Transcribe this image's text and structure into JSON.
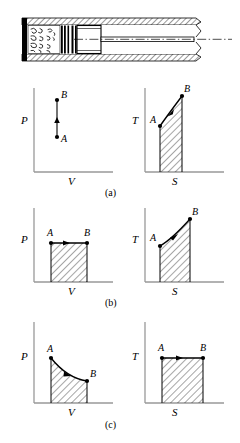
{
  "figure": {
    "apparatus": {
      "name": "insulated-cylinder-piston",
      "parts": {
        "cylinder_wall": "hatched-wall",
        "gas_region": "gas-molecules",
        "piston": "piston-block",
        "piston_rings": "piston-rings",
        "rod": "piston-rod",
        "centerline": "center-line",
        "break": "break-line"
      }
    },
    "rows": [
      {
        "caption": "(a)",
        "left": {
          "name": "pv-diagram-a",
          "ylabel": "P",
          "xlabel": "V",
          "points": [
            {
              "label": "A",
              "x": 0.3,
              "y": 0.22
            },
            {
              "label": "B",
              "x": 0.3,
              "y": 0.78
            }
          ],
          "process": "isochoric-up",
          "shaded": false,
          "arrow": "up"
        },
        "right": {
          "name": "ts-diagram-a",
          "ylabel": "T",
          "xlabel": "S",
          "points": [
            {
              "label": "A",
              "x": 0.2,
              "y": 0.56
            },
            {
              "label": "B",
              "x": 0.55,
              "y": 0.92
            }
          ],
          "process": "curve-up",
          "shaded": true,
          "arrow": "up-right"
        }
      },
      {
        "caption": "(b)",
        "left": {
          "name": "pv-diagram-b",
          "ylabel": "P",
          "xlabel": "V",
          "points": [
            {
              "label": "A",
              "x": 0.22,
              "y": 0.72
            },
            {
              "label": "B",
              "x": 0.62,
              "y": 0.72
            }
          ],
          "process": "isobaric",
          "shaded": true,
          "arrow": "right"
        },
        "right": {
          "name": "ts-diagram-b",
          "ylabel": "T",
          "xlabel": "S",
          "points": [
            {
              "label": "A",
              "x": 0.2,
              "y": 0.56
            },
            {
              "label": "B",
              "x": 0.55,
              "y": 0.92
            }
          ],
          "process": "curve-up",
          "shaded": true,
          "arrow": "up-right"
        }
      },
      {
        "caption": "(c)",
        "left": {
          "name": "pv-diagram-c",
          "ylabel": "P",
          "xlabel": "V",
          "points": [
            {
              "label": "A",
              "x": 0.22,
              "y": 0.86
            },
            {
              "label": "B",
              "x": 0.62,
              "y": 0.52
            }
          ],
          "process": "isothermal-expansion",
          "shaded": true,
          "arrow": "down-right"
        },
        "right": {
          "name": "ts-diagram-c",
          "ylabel": "T",
          "xlabel": "S",
          "points": [
            {
              "label": "A",
              "x": 0.22,
              "y": 0.76
            },
            {
              "label": "B",
              "x": 0.62,
              "y": 0.76
            }
          ],
          "process": "isothermal",
          "shaded": true,
          "arrow": "right"
        }
      }
    ],
    "style": {
      "line_color": "#000000",
      "axis_color": "#808080",
      "hatch_color": "#000000",
      "background": "#ffffff"
    }
  }
}
